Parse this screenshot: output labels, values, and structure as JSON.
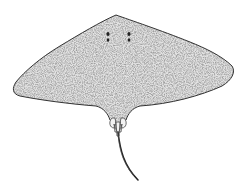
{
  "image": {
    "subject": "stingray illustration",
    "view": "dorsal",
    "style": "stippled pen drawing",
    "colors": {
      "background": "#ffffff",
      "outline": "#333333",
      "stipple": "#9a9a9a",
      "body_fill": "#dcdcdc",
      "eyes": "#222222"
    }
  }
}
